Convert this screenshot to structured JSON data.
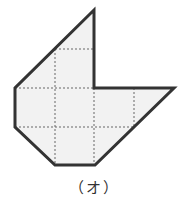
{
  "figure": {
    "label": "（オ）",
    "fill_color": "#f2f2f2",
    "outline_color": "#333333",
    "grid_color": "#666666",
    "outline_points": "94,10 94,88 174,88 95,165 55,165 15,127 15,88",
    "grid_lines": [
      {
        "x1": 55,
        "y1": 49,
        "x2": 94,
        "y2": 49
      },
      {
        "x1": 15,
        "y1": 88,
        "x2": 134,
        "y2": 88
      },
      {
        "x1": 15,
        "y1": 127,
        "x2": 134,
        "y2": 127
      },
      {
        "x1": 55,
        "y1": 49,
        "x2": 55,
        "y2": 165
      },
      {
        "x1": 94,
        "y1": 88,
        "x2": 94,
        "y2": 165
      },
      {
        "x1": 134,
        "y1": 88,
        "x2": 134,
        "y2": 127
      }
    ]
  }
}
